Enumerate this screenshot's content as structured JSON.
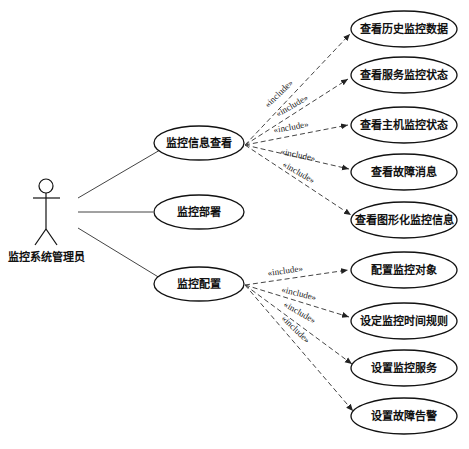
{
  "diagram": {
    "type": "use-case",
    "actor": {
      "label": "监控系统管理员"
    },
    "primary_use_cases": [
      {
        "id": "uc1",
        "label": "监控信息查看"
      },
      {
        "id": "uc2",
        "label": "监控部署"
      },
      {
        "id": "uc3",
        "label": "监控配置"
      }
    ],
    "included_use_cases": [
      {
        "label": "查看历史监控数据",
        "parent": "uc1"
      },
      {
        "label": "查看服务监控状态",
        "parent": "uc1"
      },
      {
        "label": "查看主机监控状态",
        "parent": "uc1"
      },
      {
        "label": "查看故障消息",
        "parent": "uc1"
      },
      {
        "label": "查看图形化监控信息",
        "parent": "uc1"
      },
      {
        "label": "配置监控对象",
        "parent": "uc3"
      },
      {
        "label": "设定监控时间规则",
        "parent": "uc3"
      },
      {
        "label": "设置监控服务",
        "parent": "uc3"
      },
      {
        "label": "设置故障告警",
        "parent": "uc3"
      }
    ],
    "stereotype": "«include»",
    "colors": {
      "line": "#333333",
      "text": "#111111",
      "background": "#ffffff"
    }
  }
}
